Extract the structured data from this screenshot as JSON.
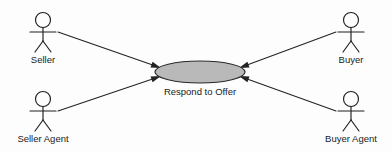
{
  "diagram": {
    "type": "uml-use-case-diagram",
    "background_color": "#fdfdfd",
    "line_color": "#232323",
    "text_color": "#1a1a1a",
    "use_case": {
      "label": "Respond to Offer",
      "fill_color": "#b9b9b9",
      "stroke_color": "#2a2a2a",
      "center": {
        "x": 200,
        "y": 72
      },
      "radius": {
        "x": 45,
        "y": 11
      },
      "label_position": {
        "x": 200,
        "y": 92
      }
    },
    "actors": [
      {
        "id": "seller",
        "label": "Seller",
        "position": {
          "x": 43,
          "y": 20
        },
        "label_position": {
          "x": 43,
          "y": 60
        }
      },
      {
        "id": "buyer",
        "label": "Buyer",
        "position": {
          "x": 351,
          "y": 20
        },
        "label_position": {
          "x": 351,
          "y": 60
        }
      },
      {
        "id": "seller-agent",
        "label": "Seller Agent",
        "position": {
          "x": 43,
          "y": 99
        },
        "label_position": {
          "x": 43,
          "y": 138
        }
      },
      {
        "id": "buyer-agent",
        "label": "Buyer Agent",
        "position": {
          "x": 351,
          "y": 99
        },
        "label_position": {
          "x": 351,
          "y": 138
        }
      }
    ],
    "associations": [
      {
        "id": "seller-to-usecase",
        "from": "seller",
        "to": "use_case",
        "direction": "to-use-case",
        "start": {
          "x": 58,
          "y": 32
        },
        "end": {
          "x": 159,
          "y": 66
        }
      },
      {
        "id": "buyer-to-usecase",
        "from": "buyer",
        "to": "use_case",
        "direction": "to-use-case",
        "start": {
          "x": 336,
          "y": 32
        },
        "end": {
          "x": 241,
          "y": 66
        }
      },
      {
        "id": "seller-agent-to-usecase",
        "from": "seller-agent",
        "to": "use_case",
        "direction": "to-use-case",
        "start": {
          "x": 58,
          "y": 111
        },
        "end": {
          "x": 159,
          "y": 78
        }
      },
      {
        "id": "buyer-agent-to-usecase",
        "from": "buyer-agent",
        "to": "use_case",
        "direction": "to-use-case",
        "start": {
          "x": 336,
          "y": 111
        },
        "end": {
          "x": 241,
          "y": 78
        }
      }
    ]
  }
}
